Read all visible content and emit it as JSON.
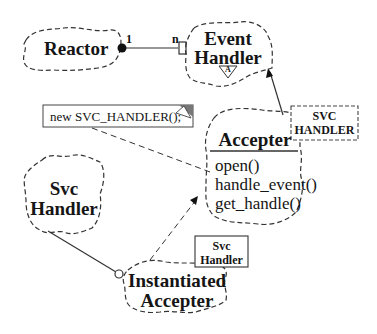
{
  "diagram": {
    "classes": {
      "reactor": {
        "label": "Reactor"
      },
      "event_handler": {
        "line1": "Event",
        "line2": "Handler",
        "abstract_marker": "A"
      },
      "accepter": {
        "label": "Accepter",
        "operations": [
          "open()",
          "handle_event()",
          "get_handle()"
        ],
        "template_param": {
          "line1": "SVC",
          "line2": "HANDLER"
        }
      },
      "svc_handler": {
        "line1": "Svc",
        "line2": "Handler"
      },
      "instantiated_accepter": {
        "line1": "Instantiated",
        "line2": "Accepter",
        "bound_param": {
          "line1": "Svc",
          "line2": "Handler"
        }
      }
    },
    "note": {
      "text": "new  SVC_HANDLER();"
    },
    "association": {
      "from_multiplicity": "1",
      "to_multiplicity": "n"
    },
    "colors": {
      "line": "#333333",
      "text": "#151515",
      "background": "#ffffff"
    }
  }
}
